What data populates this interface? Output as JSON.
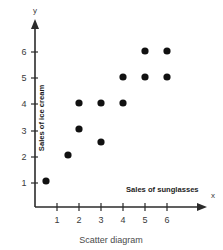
{
  "chart_data": {
    "type": "scatter",
    "title": "",
    "caption": "Scatter diagram",
    "xlabel": "Sales of sunglasses",
    "ylabel": "Sales of ice cream",
    "x_axis_name": "x",
    "y_axis_name": "y",
    "xlim": [
      0,
      6.9
    ],
    "ylim": [
      0,
      6.8
    ],
    "grid": false,
    "legend": "none",
    "xticks": [
      1,
      2,
      3,
      4,
      5,
      6
    ],
    "yticks": [
      1,
      2,
      3,
      4,
      5,
      6
    ],
    "xtick_labels": [
      "1",
      "2",
      "3",
      "4",
      "5",
      "6"
    ],
    "ytick_labels": [
      "1",
      "2",
      "3",
      "4",
      "5",
      "6"
    ],
    "marker": "filled-circle",
    "marker_color": "#111111",
    "points": [
      {
        "x": 0.5,
        "y": 1
      },
      {
        "x": 1.5,
        "y": 2
      },
      {
        "x": 2,
        "y": 3
      },
      {
        "x": 2,
        "y": 4
      },
      {
        "x": 3,
        "y": 2.5
      },
      {
        "x": 3,
        "y": 4
      },
      {
        "x": 4,
        "y": 4
      },
      {
        "x": 4,
        "y": 5
      },
      {
        "x": 5,
        "y": 5
      },
      {
        "x": 5,
        "y": 6
      },
      {
        "x": 6,
        "y": 5
      },
      {
        "x": 6,
        "y": 6
      }
    ]
  }
}
